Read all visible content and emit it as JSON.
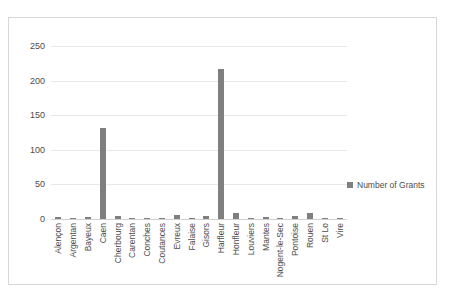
{
  "chart_data": {
    "type": "bar",
    "title": "",
    "xlabel": "",
    "ylabel": "",
    "ylim": [
      0,
      250
    ],
    "yticks": [
      0,
      50,
      100,
      150,
      200,
      250
    ],
    "grid": true,
    "legend_position": "right",
    "series_name": "Number of Grants",
    "bar_color": "#7f7f7f",
    "categories": [
      "Alençon",
      "Argentan",
      "Bayeux",
      "Caen",
      "Cherbourg",
      "Carentan",
      "Conches",
      "Coutances",
      "Evreux",
      "Falaise",
      "Gisors",
      "Harfleur",
      "Honfleur",
      "Louviers",
      "Mantes",
      "Nogent-le-Sec",
      "Pontoise",
      "Rouen",
      "St Lo",
      "Vire"
    ],
    "values": [
      3,
      1,
      3,
      132,
      4,
      1,
      1,
      1,
      6,
      1,
      4,
      217,
      8,
      2,
      3,
      1,
      4,
      9,
      1,
      1
    ],
    "series": [
      {
        "name": "Number of Grants",
        "values": [
          3,
          1,
          3,
          132,
          4,
          1,
          1,
          1,
          6,
          1,
          4,
          217,
          8,
          2,
          3,
          1,
          4,
          9,
          1,
          1
        ]
      }
    ]
  },
  "legend": {
    "label": "Number of Grants"
  },
  "axis": {
    "y_tick_labels": [
      "0",
      "50",
      "100",
      "150",
      "200",
      "250"
    ]
  }
}
